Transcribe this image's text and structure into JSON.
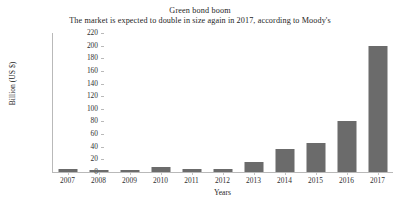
{
  "chart_data": {
    "type": "bar",
    "title": "Green bond boom",
    "subtitle": "The market is expected to double in size again in 2017, according to Moody's",
    "xlabel": "Years",
    "ylabel": "Billion (US $)",
    "categories": [
      "2007",
      "2008",
      "2009",
      "2010",
      "2011",
      "2012",
      "2013",
      "2014",
      "2015",
      "2016",
      "2017"
    ],
    "values": [
      5,
      3,
      3,
      8,
      4,
      5,
      16,
      37,
      46,
      81,
      200
    ],
    "ylim": [
      0,
      220
    ],
    "ytick_values": [
      0,
      20,
      40,
      60,
      80,
      100,
      120,
      140,
      160,
      180,
      200,
      220
    ],
    "ytick_labels": [
      "0",
      "20",
      "40",
      "60",
      "80",
      "100",
      "120",
      "140",
      "160",
      "180",
      "200",
      "220"
    ],
    "grid": false,
    "legend": false,
    "bar_color": "#6b6b6b",
    "axis_color": "#b9b9b9",
    "background_color": "#ffffff"
  }
}
